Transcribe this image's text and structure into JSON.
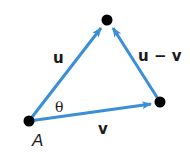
{
  "diagram": {
    "colors": {
      "vector": "#3a8fd6",
      "point": "#000000",
      "text": "#1a1a1a"
    },
    "points": [
      {
        "id": "A",
        "label": "A",
        "x": 29,
        "y": 121
      },
      {
        "id": "top",
        "label": "",
        "x": 107,
        "y": 20
      },
      {
        "id": "right",
        "label": "",
        "x": 160,
        "y": 102
      }
    ],
    "vectors": [
      {
        "id": "u",
        "label": "u",
        "from": "A",
        "to": "top"
      },
      {
        "id": "v",
        "label": "v",
        "from": "A",
        "to": "right"
      },
      {
        "id": "u_minus_v",
        "label": "u − v",
        "from": "right",
        "to": "top"
      }
    ],
    "angle": {
      "label": "θ",
      "at": "A"
    },
    "labels": {
      "u": "u",
      "v": "v",
      "u_minus_v": "u − v",
      "theta": "θ",
      "point_A": "A"
    }
  }
}
